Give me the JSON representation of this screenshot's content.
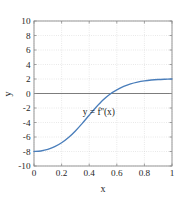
{
  "chart_data": {
    "type": "line",
    "title": "",
    "subtitle": "",
    "xlabel": "x",
    "ylabel": "y",
    "xlim": [
      0,
      1
    ],
    "ylim": [
      -10,
      10
    ],
    "grid": true,
    "legend_position": "none",
    "xticks": [
      0,
      0.2,
      0.4,
      0.6,
      0.8,
      1
    ],
    "xticklabels": [
      "0",
      "0.2",
      "0.4",
      "0.6",
      "0.8",
      "1"
    ],
    "yticks": [
      -10,
      -8,
      -6,
      -4,
      -2,
      0,
      2,
      4,
      6,
      8,
      10
    ],
    "yticklabels": [
      "-10",
      "-8",
      "-6",
      "-4",
      "-2",
      "0",
      "2",
      "4",
      "6",
      "8",
      "10"
    ],
    "annotations": [
      {
        "text": "y = f''(x)",
        "x": 0.47,
        "y": -3.0
      }
    ],
    "series": [
      {
        "name": "y = f''(x)",
        "color": "#4a7ebb",
        "x": [
          0.0,
          0.05,
          0.1,
          0.15,
          0.2,
          0.25,
          0.3,
          0.35,
          0.4,
          0.45,
          0.5,
          0.55,
          0.6,
          0.65,
          0.7,
          0.75,
          0.8,
          0.85,
          0.9,
          0.95,
          1.0
        ],
        "values": [
          -8.0,
          -7.93,
          -7.72,
          -7.34,
          -6.8,
          -6.07,
          -5.16,
          -4.12,
          -3.0,
          -1.9,
          -0.9,
          -0.1,
          0.5,
          0.97,
          1.33,
          1.58,
          1.75,
          1.86,
          1.93,
          1.97,
          2.0
        ]
      }
    ],
    "zero_crossing_x": 0.58,
    "start_value": -8,
    "end_value": 2
  },
  "axis": {
    "x_title": "x",
    "y_title": "y"
  },
  "style": {
    "curve_color": "#4a7ebb",
    "grid_color": "#c9c9c9",
    "frame_color": "#8c8c8c",
    "zero_line_color": "#6e6e6e",
    "text_color": "#262626",
    "background": "#ffffff"
  }
}
